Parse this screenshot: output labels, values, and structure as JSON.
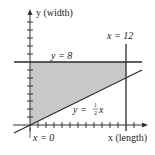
{
  "diagram": {
    "y_axis_label": "y (width)",
    "x_axis_label": "x (length)",
    "line_y8_label": "y = 8",
    "line_x12_label": "x = 12",
    "line_x0_label": "x = 0",
    "diagonal_label_prefix": "y = ",
    "diagonal_label_num": "1",
    "diagonal_label_den": "2",
    "diagonal_label_var": "x",
    "colors": {
      "shade": "#c8c8c8",
      "line": "#2a2a2a",
      "axis": "#333333"
    },
    "constraints": [
      "y = 8",
      "x = 12",
      "y = 1/2 x",
      "x = 0"
    ],
    "x_ticks": 15,
    "y_ticks": 13
  }
}
